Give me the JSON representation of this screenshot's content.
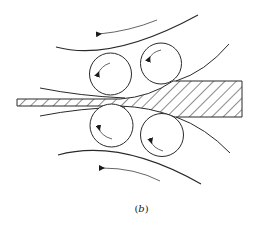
{
  "figure": {
    "caption_label": "b",
    "caption_open": "(",
    "caption_close": ")",
    "colors": {
      "line": "#2a2a2a",
      "arrow": "#555555",
      "background": "#ffffff"
    },
    "rolls": [
      {
        "id": "upper-left-roll",
        "cx": 110.5,
        "cy": 74,
        "r": 21
      },
      {
        "id": "upper-right-roll",
        "cx": 161,
        "cy": 63.5,
        "r": 20.5
      },
      {
        "id": "lower-left-roll",
        "cx": 111.5,
        "cy": 125.5,
        "r": 21.5
      },
      {
        "id": "lower-right-roll",
        "cx": 162,
        "cy": 135,
        "r": 21.5
      }
    ],
    "workpiece": {
      "thin_strip": {
        "x_start": 17,
        "top": 99,
        "bottom": 106
      },
      "thick_stock": {
        "x_end": 242,
        "top": 81,
        "bottom": 117
      }
    },
    "rotation_arrows": [
      "top-backup-arrow",
      "bottom-backup-arrow",
      "upper-left-roll-arrow",
      "upper-right-roll-arrow",
      "lower-left-roll-arrow",
      "lower-right-roll-arrow"
    ]
  }
}
